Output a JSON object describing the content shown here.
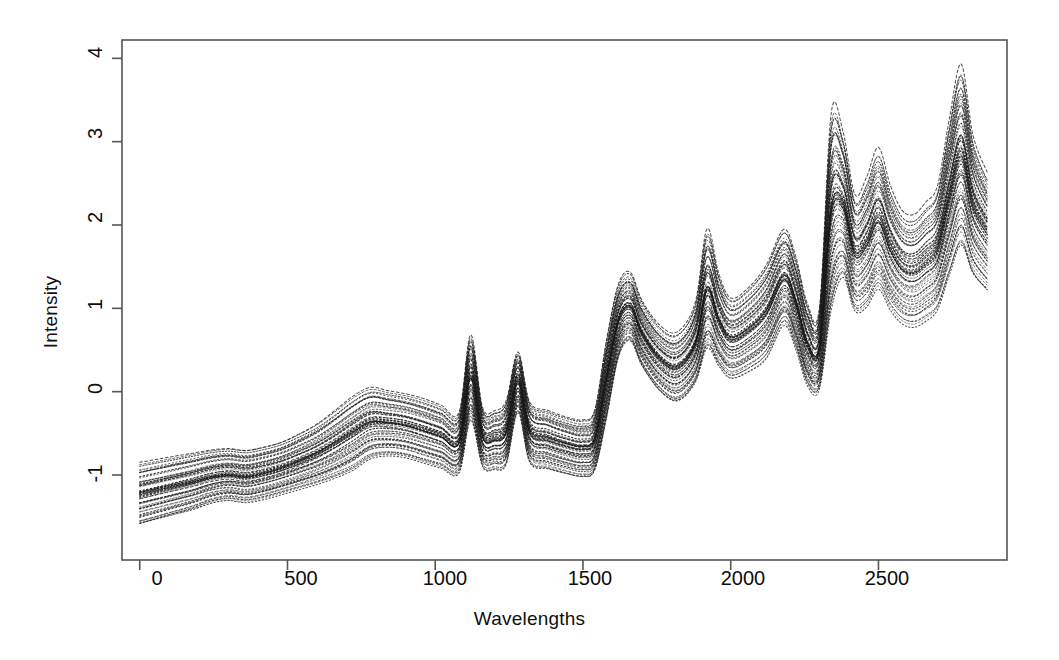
{
  "chart_data": {
    "type": "line",
    "title": "",
    "subtitle": "",
    "xlabel": "Wavelengths",
    "ylabel": "Intensity",
    "xlim": [
      -60,
      2935
    ],
    "ylim": [
      -2.02,
      4.22
    ],
    "xticks": [
      0,
      500,
      1000,
      1500,
      2000,
      2500
    ],
    "xticklabels": [
      "0",
      "500",
      "1000",
      "1500",
      "2000",
      "2500"
    ],
    "yticks": [
      -1,
      0,
      1,
      2,
      3,
      4
    ],
    "yticklabels": [
      "-1",
      "0",
      "1",
      "2",
      "3",
      "4"
    ],
    "grid": false,
    "legend": false,
    "legend_position": "none",
    "box": true,
    "n_series": 60,
    "series_color": "#1a1a1a",
    "line_style": "dotted",
    "x": [
      0,
      60,
      120,
      180,
      240,
      300,
      360,
      420,
      480,
      540,
      600,
      660,
      720,
      780,
      840,
      900,
      960,
      1020,
      1080,
      1120,
      1160,
      1200,
      1240,
      1280,
      1320,
      1380,
      1440,
      1500,
      1540,
      1580,
      1620,
      1660,
      1700,
      1760,
      1820,
      1880,
      1920,
      1960,
      2000,
      2060,
      2120,
      2180,
      2220,
      2260,
      2300,
      2340,
      2380,
      2420,
      2460,
      2500,
      2540,
      2580,
      2620,
      2660,
      2700,
      2740,
      2780,
      2820,
      2868
    ],
    "series": [
      {
        "name": "mean-spectrum",
        "values": [
          -1.3,
          -1.24,
          -1.18,
          -1.12,
          -1.05,
          -1.02,
          -1.03,
          -1.0,
          -0.95,
          -0.9,
          -0.84,
          -0.75,
          -0.62,
          -0.45,
          -0.38,
          -0.4,
          -0.45,
          -0.52,
          -0.6,
          0.1,
          -0.5,
          -0.55,
          -0.48,
          0.12,
          -0.45,
          -0.55,
          -0.62,
          -0.65,
          -0.55,
          0.2,
          0.85,
          1.05,
          0.75,
          0.42,
          0.3,
          0.55,
          1.05,
          0.8,
          0.62,
          0.75,
          0.95,
          1.35,
          1.0,
          0.55,
          0.5,
          1.8,
          2.1,
          1.55,
          1.6,
          1.85,
          1.55,
          1.35,
          1.3,
          1.4,
          1.55,
          2.1,
          2.55,
          2.05,
          1.7
        ]
      },
      {
        "name": "upper-envelope",
        "values": [
          -0.86,
          -0.82,
          -0.78,
          -0.74,
          -0.7,
          -0.68,
          -0.7,
          -0.66,
          -0.6,
          -0.5,
          -0.38,
          -0.22,
          -0.05,
          0.06,
          0.02,
          -0.02,
          -0.08,
          -0.16,
          -0.25,
          0.68,
          -0.18,
          -0.22,
          -0.1,
          0.48,
          -0.12,
          -0.22,
          -0.3,
          -0.34,
          -0.22,
          0.62,
          1.28,
          1.42,
          1.08,
          0.78,
          0.7,
          1.05,
          1.92,
          1.4,
          1.12,
          1.25,
          1.52,
          1.95,
          1.62,
          1.05,
          1.0,
          3.3,
          3.1,
          2.35,
          2.55,
          2.9,
          2.45,
          2.15,
          2.1,
          2.25,
          2.45,
          3.25,
          3.9,
          3.05,
          2.6
        ]
      },
      {
        "name": "lower-envelope",
        "values": [
          -1.62,
          -1.56,
          -1.5,
          -1.44,
          -1.36,
          -1.32,
          -1.34,
          -1.3,
          -1.24,
          -1.18,
          -1.12,
          -1.05,
          -0.96,
          -0.82,
          -0.78,
          -0.8,
          -0.86,
          -0.92,
          -0.98,
          -0.35,
          -0.9,
          -0.94,
          -0.88,
          -0.26,
          -0.86,
          -0.94,
          -1.0,
          -1.04,
          -0.96,
          -0.34,
          0.38,
          0.58,
          0.28,
          -0.02,
          -0.14,
          0.08,
          0.48,
          0.28,
          0.14,
          0.22,
          0.38,
          0.78,
          0.5,
          0.06,
          0.02,
          0.95,
          1.35,
          0.95,
          1.0,
          1.22,
          0.98,
          0.82,
          0.78,
          0.85,
          0.98,
          1.38,
          1.72,
          1.38,
          1.18
        ]
      }
    ]
  },
  "axes": {
    "x_tick_labels": [
      "0",
      "500",
      "1000",
      "1500",
      "2000",
      "2500"
    ],
    "y_tick_labels": [
      "-1",
      "0",
      "1",
      "2",
      "3",
      "4"
    ],
    "x_axis_title": "Wavelengths",
    "y_axis_title": "Intensity"
  },
  "style": {
    "background": "#ffffff",
    "frame_color": "#555555",
    "ink_color": "#111111"
  }
}
